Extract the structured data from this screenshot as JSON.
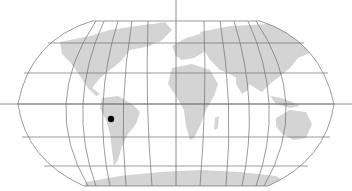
{
  "map": {
    "title": "World map",
    "projection": "Robinson-like",
    "colors": {
      "background": "#ffffff",
      "land": "#d4d4d4",
      "graticule": "#707070",
      "crosshair": "#707070",
      "marker": "#000000"
    },
    "graticule": {
      "parallels_y": [
        21,
        43,
        73,
        104,
        137,
        166,
        186
      ],
      "meridians_count": 13
    },
    "crosshair": {
      "x": 176,
      "y": 104
    },
    "marker": {
      "label": "Location marker",
      "x": 111,
      "y": 119,
      "region": "South America (Peru/Bolivia)"
    }
  }
}
